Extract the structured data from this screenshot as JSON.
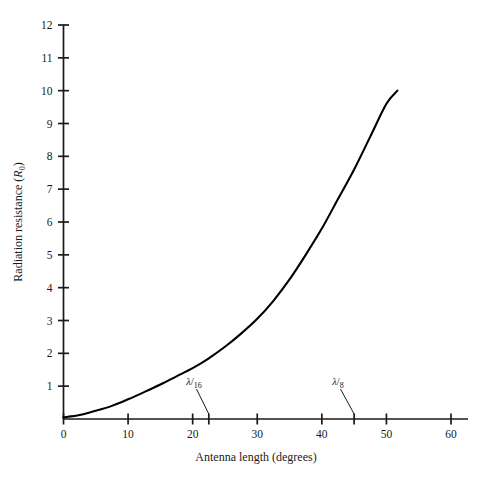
{
  "chart_data": {
    "type": "line",
    "title": "",
    "xlabel": "Antenna length (degrees)",
    "ylabel": "Radiation resistance (R₀)",
    "ylabel_text": "Radiation resistance",
    "ylabel_symbol": "R",
    "ylabel_symbol_sub": "0",
    "xlim": [
      0,
      60
    ],
    "ylim": [
      0,
      12
    ],
    "grid": false,
    "legend": null,
    "xticks": [
      0,
      10,
      20,
      30,
      40,
      50,
      60
    ],
    "xtick_labels": [
      "0",
      "10",
      "20",
      "30",
      "40",
      "50",
      "60"
    ],
    "yticks": [
      1,
      2,
      3,
      4,
      5,
      6,
      7,
      8,
      9,
      10,
      11,
      12
    ],
    "ytick_labels": [
      "1",
      "2",
      "3",
      "4",
      "5",
      "6",
      "7",
      "8",
      "9",
      "10",
      "11",
      "12"
    ],
    "series": [
      {
        "name": "Radiation resistance",
        "color": "#000000",
        "x": [
          0,
          2.5,
          5,
          7.5,
          10,
          12.5,
          15,
          17.5,
          20,
          22.5,
          25,
          27.5,
          30,
          32.5,
          35,
          37.5,
          40,
          42.5,
          45,
          47.5,
          50,
          51.7
        ],
        "y": [
          0.05,
          0.12,
          0.25,
          0.4,
          0.6,
          0.82,
          1.05,
          1.3,
          1.55,
          1.85,
          2.2,
          2.6,
          3.05,
          3.6,
          4.25,
          5.0,
          5.8,
          6.7,
          7.6,
          8.6,
          9.6,
          10.0
        ]
      }
    ],
    "annotations": [
      {
        "name": "lambda-over-16",
        "symbol": "λ",
        "denominator": "16",
        "label": "λ/16",
        "point_x": 22.5,
        "point_y": 0,
        "label_x": 20.2,
        "label_y": 1.05
      },
      {
        "name": "lambda-over-8",
        "symbol": "λ",
        "denominator": "8",
        "label": "λ/8",
        "point_x": 45,
        "point_y": 0,
        "label_x": 42.5,
        "label_y": 1.05
      }
    ]
  }
}
